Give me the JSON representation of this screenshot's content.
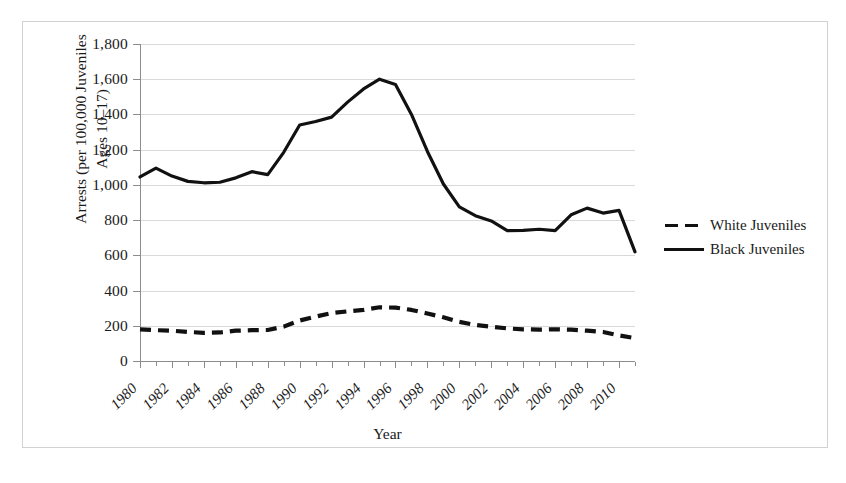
{
  "chart_data": {
    "type": "line",
    "title": "",
    "xlabel": "Year",
    "ylabel": "Arrests (per 100,000 Juveniles Ages 10–17)",
    "ylim": [
      0,
      1800
    ],
    "ytick_step": 200,
    "ytick_labels": [
      "1,800",
      "1,600",
      "1,400",
      "1,200",
      "1,000",
      "800",
      "600",
      "400",
      "200",
      "0"
    ],
    "ytick_values": [
      1800,
      1600,
      1400,
      1200,
      1000,
      800,
      600,
      400,
      200,
      0
    ],
    "xlim": [
      1980,
      2011
    ],
    "x": [
      1980,
      1981,
      1982,
      1983,
      1984,
      1985,
      1986,
      1987,
      1988,
      1989,
      1990,
      1991,
      1992,
      1993,
      1994,
      1995,
      1996,
      1997,
      1998,
      1999,
      2000,
      2001,
      2002,
      2003,
      2004,
      2005,
      2006,
      2007,
      2008,
      2009,
      2010,
      2011
    ],
    "xtick_labels": [
      "1980",
      "1982",
      "1984",
      "1986",
      "1988",
      "1990",
      "1992",
      "1994",
      "1996",
      "1998",
      "2000",
      "2002",
      "2004",
      "2006",
      "2008",
      "2010"
    ],
    "xtick_values": [
      1980,
      1982,
      1984,
      1986,
      1988,
      1990,
      1992,
      1994,
      1996,
      1998,
      2000,
      2002,
      2004,
      2006,
      2008,
      2010
    ],
    "grid": "horizontal",
    "legend_position": "right",
    "series": [
      {
        "name": "White Juveniles",
        "style": "dashed",
        "color": "#111111",
        "values": [
          180,
          175,
          172,
          165,
          160,
          162,
          172,
          175,
          176,
          195,
          230,
          252,
          272,
          282,
          290,
          305,
          303,
          290,
          270,
          248,
          222,
          205,
          195,
          185,
          180,
          178,
          180,
          178,
          172,
          165,
          145,
          130
        ]
      },
      {
        "name": "Black Juveniles",
        "style": "solid",
        "color": "#111111",
        "values": [
          1045,
          1095,
          1050,
          1020,
          1012,
          1015,
          1040,
          1075,
          1058,
          1185,
          1340,
          1360,
          1385,
          1470,
          1545,
          1600,
          1570,
          1400,
          1190,
          1005,
          875,
          825,
          795,
          740,
          742,
          748,
          740,
          830,
          868,
          840,
          855,
          620
        ]
      }
    ]
  },
  "legend": {
    "items": [
      {
        "label": "White Juveniles",
        "style": "dashed"
      },
      {
        "label": "Black Juveniles",
        "style": "solid"
      }
    ]
  },
  "axes": {
    "x_title": "Year",
    "y_title_line1": "Arrests (per 100,000 Juveniles",
    "y_title_line2": "Ages 10–17)"
  }
}
